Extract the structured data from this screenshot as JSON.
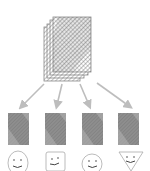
{
  "diagram": {
    "colors": {
      "background": "#ffffff",
      "hatch": "#555555",
      "tile_fill": "#8a8a8a",
      "arrow": "#bdbdbd",
      "outline": "#9a9a9a",
      "face_stroke": "#555555"
    },
    "stack": {
      "label": "document-stack",
      "page_count": 4
    },
    "branches": [
      {
        "id": "branch-1",
        "tile": "hatched-tile",
        "face_shape": "oval"
      },
      {
        "id": "branch-2",
        "tile": "hatched-tile",
        "face_shape": "square"
      },
      {
        "id": "branch-3",
        "tile": "hatched-tile",
        "face_shape": "circle"
      },
      {
        "id": "branch-4",
        "tile": "hatched-tile",
        "face_shape": "inverted-triangle"
      }
    ]
  }
}
